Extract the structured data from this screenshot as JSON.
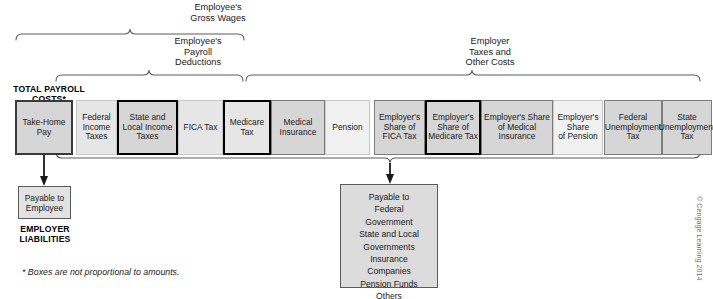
{
  "groups": {
    "gross_wages": "Employee's\nGross Wages",
    "payroll_deductions": "Employee's\nPayroll\nDeductions",
    "employer_taxes": "Employer\nTaxes and\nOther Costs"
  },
  "corner_label": "TOTAL PAYROLL\nCOSTS*",
  "employer_liabilities_label": "EMPLOYER\nLIABILITIES",
  "boxes": [
    {
      "label": "Take-Home\nPay",
      "x": 15,
      "w": 58,
      "shade": "sh-med",
      "border": "bd-thick"
    },
    {
      "label": "Federal\nIncome\nTaxes",
      "x": 76,
      "w": 41,
      "shade": "sh-light",
      "border": "bd-thin"
    },
    {
      "label": "State and\nLocal Income\nTaxes",
      "x": 117,
      "w": 61,
      "shade": "sh-med",
      "border": "bd-black"
    },
    {
      "label": "FICA Tax",
      "x": 178,
      "w": 45,
      "shade": "sh-light",
      "border": "bd-thin"
    },
    {
      "label": "Medicare\nTax",
      "x": 223,
      "w": 48,
      "shade": "sh-light",
      "border": "bd-black"
    },
    {
      "label": "Medical\nInsurance",
      "x": 271,
      "w": 54,
      "shade": "sh-med",
      "border": "bd-mid"
    },
    {
      "label": "Pension",
      "x": 325,
      "w": 45,
      "shade": "sh-xlight",
      "border": "bd-thin"
    },
    {
      "label": "Employer's\nShare of\nFICA Tax",
      "x": 374,
      "w": 51,
      "shade": "sh-med",
      "border": "bd-mid"
    },
    {
      "label": "Employer's\nShare of\nMedicare Tax",
      "x": 425,
      "w": 56,
      "shade": "sh-med",
      "border": "bd-black"
    },
    {
      "label": "Employer's Share\nof Medical\nInsurance",
      "x": 481,
      "w": 72,
      "shade": "sh-med",
      "border": "bd-mid"
    },
    {
      "label": "Employer's\nShare\nof Pension",
      "x": 553,
      "w": 50,
      "shade": "sh-xlight",
      "border": "bd-thin"
    },
    {
      "label": "Federal\nUnemployment\nTax",
      "x": 604,
      "w": 58,
      "shade": "sh-med",
      "border": "bd-mid"
    },
    {
      "label": "State\nUnemployment\nTax",
      "x": 662,
      "w": 50,
      "shade": "sh-med",
      "border": "bd-mid"
    }
  ],
  "payable_to_employee": "Payable to\nEmployee",
  "payable_to_government": "Payable to\n   Federal\n      Government\n   State and Local\n      Governments\n   Insurance\n      Companies\n   Pension Funds\n   Others",
  "footnote": "* Boxes are not proportional to amounts.",
  "copyright": "© Cengage Learning 2014",
  "colors": {
    "box_medium": "#d6d6d6",
    "box_light": "#e6e6e6",
    "box_xlight": "#f1f1f1",
    "border_dark": "#3a3a3a",
    "border_black": "#000000",
    "text": "#1a1a1a"
  }
}
